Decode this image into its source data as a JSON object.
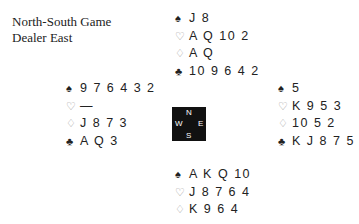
{
  "info": {
    "vulnerability": "North-South Game",
    "dealer": "Dealer East"
  },
  "suit_symbols": {
    "spades": "♠",
    "hearts": "♡",
    "diamonds": "♢",
    "clubs": "♣"
  },
  "hands": {
    "north": {
      "spades": "J 8",
      "hearts": "A Q 10 2",
      "diamonds": "A Q",
      "clubs": "10 9 6 4 2"
    },
    "west": {
      "spades": "9 7 6 4 3 2",
      "hearts": "—",
      "diamonds": "J 8 7 3",
      "clubs": "A Q 3"
    },
    "east": {
      "spades": "5",
      "hearts": "K 9 5 3",
      "diamonds": "10 5 2",
      "clubs": "K J 8 7 5"
    },
    "south": {
      "spades": "A K Q 10",
      "hearts": "J 8 7 6 4",
      "diamonds": "K 9 6 4",
      "clubs": "—"
    }
  },
  "compass": {
    "n": "N",
    "s": "S",
    "w": "W",
    "e": "E"
  }
}
